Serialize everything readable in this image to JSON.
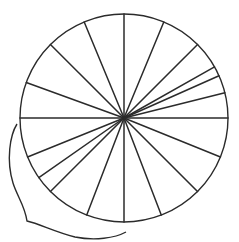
{
  "diagram": {
    "type": "circle-divided-into-sectors",
    "sector_count": 18,
    "spoke_angles_deg": [
      0,
      14,
      24,
      29.5,
      45,
      67.5,
      90,
      112.5,
      135,
      160,
      180,
      202,
      215,
      225,
      249,
      270,
      291,
      315,
      338
    ],
    "stroke_color": "#2b2b2b",
    "background_color": "#ffffff",
    "brace": {
      "present": true,
      "spans": "lower-left arc from the horizontal left radius to the bottom vertical radius"
    }
  }
}
